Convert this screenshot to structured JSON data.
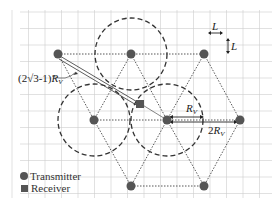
{
  "diagram": {
    "annotations": {
      "distance_label_prefix": "(2√3-1)",
      "distance_label_symbol": "R",
      "distance_label_sub": "V",
      "rv_label_symbol": "R",
      "rv_label_sub": "V",
      "two_rv_label_prefix": "2",
      "two_rv_label_symbol": "R",
      "two_rv_label_sub": "V",
      "grid_x_label": "L",
      "grid_y_label": "L"
    },
    "transmitters": [
      {
        "row": 0,
        "col": 0
      },
      {
        "row": 0,
        "col": 1
      },
      {
        "row": 0,
        "col": 2
      },
      {
        "row": 1,
        "col": 0
      },
      {
        "row": 1,
        "col": 1
      },
      {
        "row": 1,
        "col": 2
      },
      {
        "row": 2,
        "col": 0
      },
      {
        "row": 2,
        "col": 1
      }
    ],
    "coverage_circles": [
      "top-center",
      "middle-left",
      "middle-center"
    ],
    "colors": {
      "node": "#555555",
      "grid": "#cccccc",
      "dashed": "#333333",
      "dotted": "#444444"
    }
  },
  "legend": {
    "transmitter_label": "Transmitter",
    "receiver_label": "Receiver"
  }
}
